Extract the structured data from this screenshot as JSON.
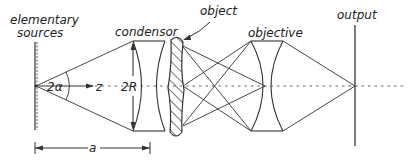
{
  "diagram": {
    "type": "optical-system",
    "labels": {
      "sources_line1": "elementary",
      "sources_line2": "sources",
      "condensor": "condensor",
      "object": "object",
      "objective": "objective",
      "output": "output",
      "angle": "2α",
      "axis": "z",
      "aperture": "2R",
      "distance": "a"
    },
    "colors": {
      "stroke": "#333333",
      "background": "#ffffff"
    }
  }
}
